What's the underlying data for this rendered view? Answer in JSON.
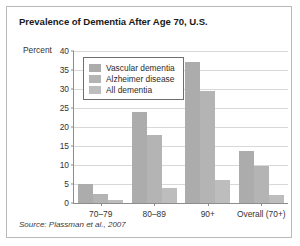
{
  "figure": {
    "title": "Prevalence of Dementia After Age 70, U.S.",
    "source_note": "Source: Plassman et al., 2007"
  },
  "chart_data": {
    "type": "bar",
    "title": "Prevalence of Dementia After Age 70, U.S.",
    "xlabel": "",
    "ylabel": "Percent",
    "ylim": [
      0,
      40
    ],
    "yticks": [
      0,
      5,
      10,
      15,
      20,
      25,
      30,
      35,
      40
    ],
    "grid": true,
    "legend_position": "top-left",
    "categories": [
      "70–79",
      "80–89",
      "90+",
      "Overall (70+)"
    ],
    "series": [
      {
        "name": "Vascular dementia",
        "color": "#acacac",
        "values": [
          5.0,
          24.0,
          37.0,
          13.8
        ]
      },
      {
        "name": "Alzheimer disease",
        "color": "#b4b4b4",
        "values": [
          2.3,
          18.0,
          29.5,
          9.7
        ]
      },
      {
        "name": "All dementia",
        "color": "#bdbdbd",
        "values": [
          0.8,
          4.0,
          6.0,
          2.2
        ]
      }
    ]
  },
  "colors": {
    "frame": "#b9b9b9",
    "axis": "#8d8d8d",
    "gridline": "#d8d8d8",
    "legend_border": "#6f6f6f",
    "text": "#333333"
  }
}
